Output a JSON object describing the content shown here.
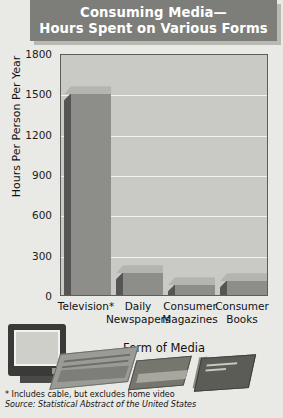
{
  "title": {
    "line1": "Consuming Media—",
    "line2": "Hours Spent on Various Forms"
  },
  "chart_data": {
    "type": "bar",
    "title": "Consuming Media— Hours Spent on Various Forms",
    "xlabel": "Form of Media",
    "ylabel": "Hours Per Person Per Year",
    "categories": [
      "Television*",
      "Daily Newspapers",
      "Consumer Magazines",
      "Consumer Books"
    ],
    "values": [
      1500,
      170,
      80,
      110
    ],
    "ylim": [
      0,
      1800
    ],
    "yticks": [
      0,
      300,
      600,
      900,
      1200,
      1500,
      1800
    ],
    "ytick_labels": [
      "0",
      "300",
      "600",
      "900",
      "1200",
      "1500",
      "1800"
    ],
    "grid": true,
    "legend": "none",
    "bar_style": "3d",
    "annotations": [
      "* Includes cable, but excludes home video",
      "Source: Statistical Abstract of the United States"
    ]
  },
  "footnotes": {
    "asterisk": "* Includes cable, but excludes home video",
    "source_label": "Source:",
    "source_text": " Statistical Abstract of the United States"
  },
  "illustrations": [
    {
      "name": "television-illustration"
    },
    {
      "name": "newspaper-illustration"
    },
    {
      "name": "magazine-illustration"
    },
    {
      "name": "book-illustration"
    }
  ],
  "colors": {
    "background": "#e9e9e6",
    "title_box": "#7d7d7a",
    "title_shadow": "#b9b9b4",
    "plot_background": "#c9c9c5",
    "bar_face": "#8d8d8a",
    "bar_side": "#555553",
    "bar_top": "#b4b4b0",
    "gridline": "#f2f2ef",
    "text": "#111111"
  }
}
